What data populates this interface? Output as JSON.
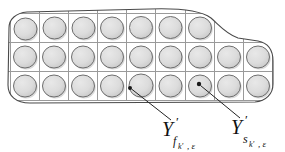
{
  "figure": {
    "type": "mathematical-diagram",
    "background_color": "#ffffff",
    "blob": {
      "outline_color": "#4a4a4a",
      "fill_color": "#ffffff",
      "outline_width": 1
    },
    "grid": {
      "line_color": "#9a9a9a",
      "line_width": 1,
      "cell_size": 29,
      "origin_x": 10,
      "origin_y": 13,
      "rows": [
        {
          "index": 1,
          "y_top": 13,
          "y_bottom": 42,
          "columns": 7,
          "x_start": 10
        },
        {
          "index": 2,
          "y_top": 42,
          "y_bottom": 71,
          "columns": 9,
          "x_start": 10
        },
        {
          "index": 3,
          "y_top": 71,
          "y_bottom": 100,
          "columns": 9,
          "x_start": 10
        }
      ],
      "total_cells": 25
    },
    "disc": {
      "fill_color": "#dcdcdc",
      "stroke_color": "#6e6e6e",
      "radius": 11,
      "shadow_color": "#b4b4b4"
    },
    "markers": [
      {
        "name": "point-f",
        "x": 130,
        "y": 88,
        "color": "#1a1a1a"
      },
      {
        "name": "point-s",
        "x": 199,
        "y": 84,
        "color": "#1a1a1a"
      }
    ],
    "leaders": [
      {
        "name": "leader-f",
        "from_x": 171,
        "from_y": 120,
        "to_x": 131,
        "to_y": 89
      },
      {
        "name": "leader-s",
        "from_x": 240,
        "from_y": 118,
        "to_x": 200,
        "to_y": 85
      }
    ]
  },
  "labels": {
    "left": {
      "name": "label-Y-prime-f",
      "base": "Y",
      "prime": "′",
      "subscript_main": "f",
      "subscript_of_subscript": "k′",
      "subscript_tail": ", ε",
      "plain": "Y′_{f_{k′},ε}",
      "x": 168,
      "y": 134
    },
    "right": {
      "name": "label-Y-prime-s",
      "base": "Y",
      "prime": "′",
      "subscript_main": "s",
      "subscript_of_subscript": "k′",
      "subscript_tail": ", ε",
      "plain": "Y′_{s_{k′},ε}",
      "x": 237,
      "y": 132
    }
  }
}
